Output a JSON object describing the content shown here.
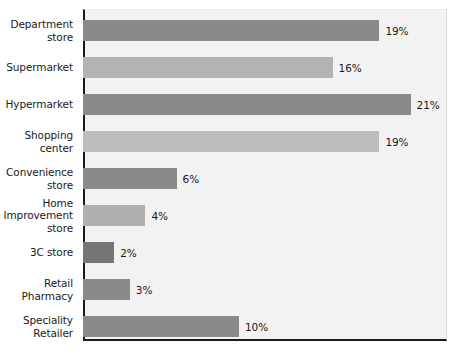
{
  "chart_data": {
    "type": "bar",
    "orientation": "horizontal",
    "title": "",
    "subtitle": "",
    "xlabel": "",
    "ylabel": "",
    "xlim": [
      0,
      23
    ],
    "grid": false,
    "legend": "none",
    "value_suffix": "%",
    "px_per_unit": 15.6,
    "categories": [
      "Department\nstore",
      "Supermarket",
      "Hypermarket",
      "Shopping\ncenter",
      "Convenience\nstore",
      "Home\nImprovement\nstore",
      "3C store",
      "Retail\nPharmacy",
      "Speciality\nRetailer"
    ],
    "values": [
      19,
      16,
      21,
      19,
      6,
      4,
      2,
      3,
      10
    ],
    "labels": [
      "19%",
      "16%",
      "21%",
      "19%",
      "6%",
      "4%",
      "2%",
      "3%",
      "10%"
    ],
    "bar_colors": [
      "#8a8a8a",
      "#b3b3b3",
      "#8a8a8a",
      "#bdbdbd",
      "#8a8a8a",
      "#b0b0b0",
      "#757575",
      "#8a8a8a",
      "#8a8a8a"
    ],
    "plot_background": "#f2f2f2",
    "axis_color": "#1a1a1a",
    "text_color": "#1a1a1a"
  }
}
